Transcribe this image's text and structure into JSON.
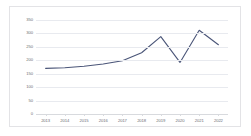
{
  "chart_data": {
    "type": "line",
    "title": "",
    "subtitle": "",
    "xlabel": "",
    "ylabel": "",
    "categories": [
      "2013",
      "2014",
      "2015",
      "2016",
      "2017",
      "2018",
      "2019",
      "2020",
      "2021",
      "2022"
    ],
    "values": [
      170,
      172,
      178,
      186,
      198,
      228,
      288,
      192,
      312,
      258
    ],
    "series": [
      {
        "name": "",
        "values": [
          170,
          172,
          178,
          186,
          198,
          228,
          288,
          192,
          312,
          258
        ]
      }
    ],
    "yticks": [
      0,
      50,
      100,
      150,
      200,
      250,
      300,
      350
    ],
    "ytick_labels": [
      "0",
      "50",
      "100",
      "150",
      "200",
      "250",
      "300",
      "350"
    ],
    "ylim": [
      0,
      350
    ],
    "grid": true,
    "legend": "none",
    "line_color": "#4a5578",
    "grid_color": "#e8eaef",
    "axis_color": "#d8dade",
    "tick_label_color": "#6f6f76",
    "background_color": "#ffffff",
    "border_color": "#e3e3e6"
  }
}
